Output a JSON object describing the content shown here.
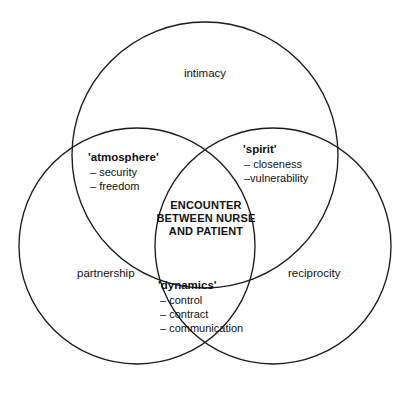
{
  "diagram": {
    "type": "venn-3-circle",
    "background_color": "#ffffff",
    "stroke_color": "#1a1a1a",
    "outer_labels": [
      {
        "id": "intimacy",
        "text": "intimacy"
      },
      {
        "id": "partnership",
        "text": "partnership"
      },
      {
        "id": "reciprocity",
        "text": "reciprocity"
      }
    ],
    "overlap_groups": [
      {
        "id": "atmosphere",
        "title": "'atmosphere'",
        "items": [
          "– security",
          "– freedom"
        ]
      },
      {
        "id": "spirit",
        "title": "'spirit'",
        "items": [
          "– closeness",
          "–vulnerability"
        ]
      },
      {
        "id": "dynamics",
        "title": "'dynamics'",
        "items": [
          "– control",
          "– contract",
          "– communication"
        ]
      }
    ],
    "center": {
      "id": "encounter",
      "lines": [
        "ENCOUNTER",
        "BETWEEN NURSE",
        "AND PATIENT"
      ]
    }
  }
}
